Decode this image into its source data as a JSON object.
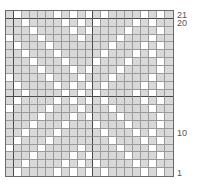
{
  "chart_data": {
    "type": "heatmap",
    "title": "",
    "columns": 21,
    "rows": 21,
    "row_labels": [
      {
        "row": 21,
        "text": "21"
      },
      {
        "row": 20,
        "text": "20"
      },
      {
        "row": 10,
        "text": "10"
      },
      {
        "row": 1,
        "text": "1"
      }
    ],
    "legend": {
      "1": "contrast color (gray)",
      "0": "background (white)"
    },
    "colors": {
      "filled": "#d9d9d9",
      "empty": "#ffffff",
      "grid": "#9a9a9a",
      "grid_major": "#4a4a4a"
    },
    "grid_top_to_bottom": [
      "101111010101011110101",
      "110111101010111101011",
      "111011110101111011101",
      "011101111011110111011",
      "101110111111101110101",
      "110111011111011101011",
      "111011101110111011101",
      "111101110101110111101",
      "011110111011101111011",
      "101111010101011110101",
      "110111101010111101011",
      "101111010101011110101",
      "011110111011101111011",
      "111101110101110111101",
      "111011101110111011101",
      "110111011111011101011",
      "101110111111101110101",
      "011101111011110111011",
      "111011110101111011101",
      "110111101010111101011",
      "101111010101011110101"
    ]
  },
  "labels": {
    "r21": "21",
    "r20": "20",
    "r10": "10",
    "r1": "1"
  }
}
